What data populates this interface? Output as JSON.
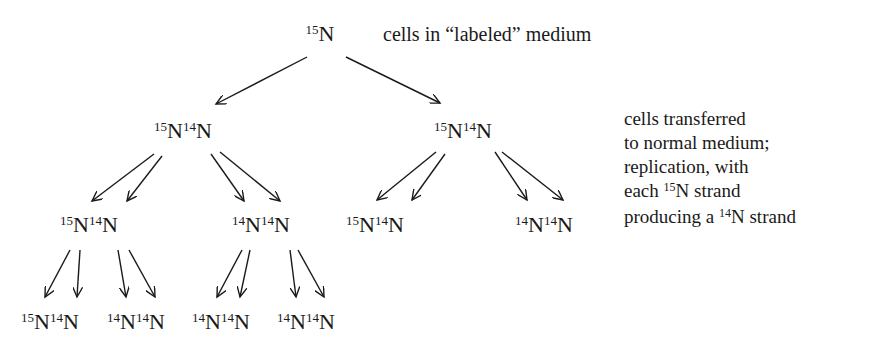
{
  "diagram": {
    "title_label": "cells in “labeled” medium",
    "root": {
      "iso1": "15",
      "el1": "N"
    },
    "gen1": [
      {
        "iso1": "15",
        "el1": "N",
        "iso2": "14",
        "el2": "N"
      },
      {
        "iso1": "15",
        "el1": "N",
        "iso2": "14",
        "el2": "N"
      }
    ],
    "gen2": [
      {
        "iso1": "15",
        "el1": "N",
        "iso2": "14",
        "el2": "N"
      },
      {
        "iso1": "14",
        "el1": "N",
        "iso2": "14",
        "el2": "N"
      },
      {
        "iso1": "15",
        "el1": "N",
        "iso2": "14",
        "el2": "N"
      },
      {
        "iso1": "14",
        "el1": "N",
        "iso2": "14",
        "el2": "N"
      }
    ],
    "gen3": [
      {
        "iso1": "15",
        "el1": "N",
        "iso2": "14",
        "el2": "N"
      },
      {
        "iso1": "14",
        "el1": "N",
        "iso2": "14",
        "el2": "N"
      },
      {
        "iso1": "14",
        "el1": "N",
        "iso2": "14",
        "el2": "N"
      },
      {
        "iso1": "14",
        "el1": "N",
        "iso2": "14",
        "el2": "N"
      }
    ],
    "side_note": {
      "line1": "cells transferred",
      "line2": "to normal medium;",
      "line3": "replication, with",
      "line4_pre": "each ",
      "line4_iso": "15",
      "line4_post": "N strand",
      "line5_pre": "producing a ",
      "line5_iso": "14",
      "line5_post": "N strand"
    }
  }
}
